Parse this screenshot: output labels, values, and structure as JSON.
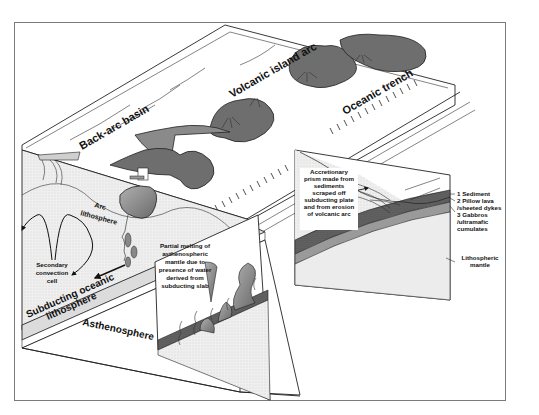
{
  "diagram": {
    "type": "block-diagram",
    "colors": {
      "background": "#ffffff",
      "frame_border": "#7a7a7a",
      "line": "#222222",
      "island_fill": "#6e6e6e",
      "magma_fill": "#8a8a8a",
      "surface_fill": "#ffffff",
      "lithosphere_fill": "#ececec",
      "crust_dark": "#3a3a3a",
      "crust_mid": "#9a9a9a"
    },
    "labels": {
      "back_arc_basin": "Back-arc basin",
      "volcanic_island_arc": "Volcanic island arc",
      "oceanic_trench": "Oceanic trench",
      "arc_lithosphere_1": "Arc",
      "arc_lithosphere_2": "lithosphere",
      "secondary_convection_1": "Secondary",
      "secondary_convection_2": "convection",
      "secondary_convection_3": "cell",
      "subducting_1": "Subducting oceanic",
      "subducting_2": "lithosphere",
      "asthenosphere": "Asthenosphere",
      "partial_melting": [
        "Partial melting of",
        "asthenospheric",
        "mantle due to",
        "presence of water",
        "derived from",
        "subducting slab"
      ],
      "accretionary_prism": [
        "Accretionary",
        "prism made from",
        "sediments",
        "scraped off",
        "subducting plate",
        "and from erosion",
        "of volcanic arc"
      ],
      "layer_1": "1  Sediment",
      "layer_2a": "2  Pillow lava",
      "layer_2b": "/sheeted dykes",
      "layer_3a": "3  Gabbros",
      "layer_3b": "/ultramafic",
      "layer_3c": "cumulates",
      "lithospheric_mantle_1": "Lithospheric",
      "lithospheric_mantle_2": "mantle"
    }
  }
}
